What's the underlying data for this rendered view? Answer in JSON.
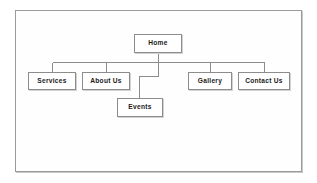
{
  "diagram": {
    "type": "site-map-tree",
    "root": {
      "id": "home",
      "label": "Home"
    },
    "children": [
      {
        "id": "services",
        "label": "Services"
      },
      {
        "id": "about",
        "label": "About Us"
      },
      {
        "id": "events",
        "label": "Events"
      },
      {
        "id": "gallery",
        "label": "Gallery"
      },
      {
        "id": "contact",
        "label": "Contact Us"
      }
    ],
    "colors": {
      "frame_border": "#9a9a9a",
      "node_border": "#8c8c8c",
      "node_fill": "#ffffff",
      "connector": "#8c8c8c",
      "text": "#1a1a1a",
      "background": "#ffffff"
    }
  }
}
